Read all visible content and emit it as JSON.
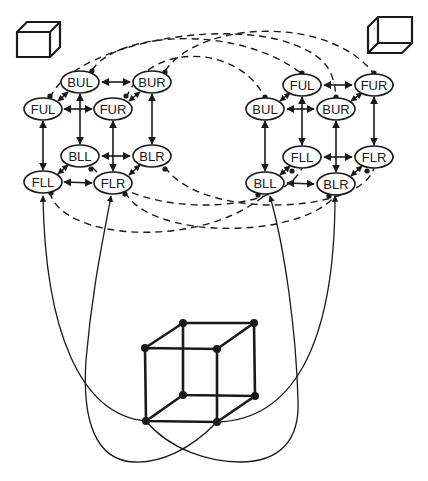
{
  "diagram": {
    "colors": {
      "ink": "#1a1a1a",
      "background": "#ffffff"
    },
    "icons": {
      "left": "cube-icon-viewed-from-above",
      "right": "cube-icon-viewed-from-below"
    },
    "left_network": {
      "nodes": [
        {
          "id": "BUL",
          "label": "BUL"
        },
        {
          "id": "BUR",
          "label": "BUR"
        },
        {
          "id": "FUL",
          "label": "FUL"
        },
        {
          "id": "FUR",
          "label": "FUR"
        },
        {
          "id": "BLL",
          "label": "BLL"
        },
        {
          "id": "BLR",
          "label": "BLR"
        },
        {
          "id": "FLL",
          "label": "FLL"
        },
        {
          "id": "FLR",
          "label": "FLR"
        }
      ]
    },
    "right_network": {
      "nodes": [
        {
          "id": "FUL",
          "label": "FUL"
        },
        {
          "id": "FUR",
          "label": "FUR"
        },
        {
          "id": "BUL",
          "label": "BUL"
        },
        {
          "id": "BUR",
          "label": "BUR"
        },
        {
          "id": "FLL",
          "label": "FLL"
        },
        {
          "id": "FLR",
          "label": "FLR"
        },
        {
          "id": "BLL",
          "label": "BLL"
        },
        {
          "id": "BLR",
          "label": "BLR"
        }
      ]
    },
    "edges": {
      "excitatory": "solid double-headed arrows within each network",
      "inhibitory": "dashed lines with filled-circle endpoints between networks"
    },
    "necker_cube": {
      "vertices": 8,
      "note": "Necker cube at bottom; input lines connect its front-left vertices to the lower nodes of both networks"
    }
  }
}
